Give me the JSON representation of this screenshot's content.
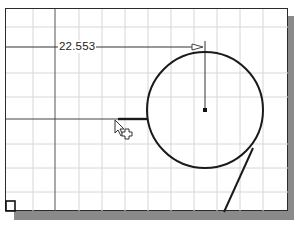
{
  "viewport": {
    "background": "#ffffff",
    "grid_color": "#d4d4d4",
    "line_color": "#2b2b2b"
  },
  "dimension": {
    "value": "22.553",
    "type": "horizontal-linear"
  },
  "sketch": {
    "circle": {
      "cx": 205,
      "cy": 110,
      "r": 58
    },
    "center_point": {
      "x": 205,
      "y": 110
    },
    "construction_line_vertical_x": 55,
    "construction_line_horizontal_y": 119,
    "tangent_line": {
      "x1": 252,
      "y1": 150,
      "x2": 224,
      "y2": 212
    }
  },
  "cursor": {
    "type": "arrow-with-crosshair",
    "x": 116,
    "y": 120
  }
}
